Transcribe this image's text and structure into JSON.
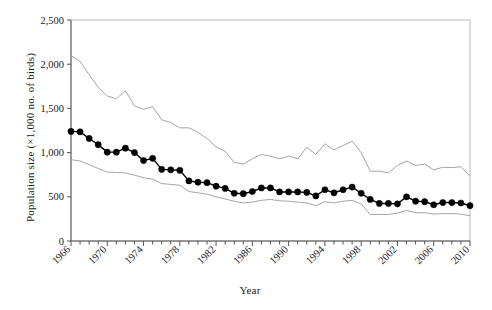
{
  "chart_data": {
    "type": "line",
    "title": "",
    "xlabel": "Year",
    "ylabel": "Population size (×1,000 no. of birds)",
    "xlim": [
      1966,
      2010
    ],
    "ylim": [
      0,
      2500
    ],
    "ytick_values": [
      0,
      500,
      1000,
      1500,
      2000,
      2500
    ],
    "ytick_labels": [
      "0",
      "500",
      "1,000",
      "1,500",
      "2,000",
      "2,500"
    ],
    "xtick_values": [
      1966,
      1970,
      1974,
      1978,
      1982,
      1986,
      1990,
      1994,
      1998,
      2002,
      2006,
      2010
    ],
    "xtick_labels": [
      "1966",
      "1970",
      "1974",
      "1978",
      "1982",
      "1986",
      "1990",
      "1994",
      "1998",
      "2002",
      "2006",
      "2010"
    ],
    "xtick_minor_step": 1,
    "xtick_label_rotation": -45,
    "grid": false,
    "legend": "none",
    "x": [
      1966,
      1967,
      1968,
      1969,
      1970,
      1971,
      1972,
      1973,
      1974,
      1975,
      1976,
      1977,
      1978,
      1979,
      1980,
      1981,
      1982,
      1983,
      1984,
      1985,
      1986,
      1987,
      1988,
      1989,
      1990,
      1991,
      1992,
      1993,
      1994,
      1995,
      1996,
      1997,
      1998,
      1999,
      2000,
      2001,
      2002,
      2003,
      2004,
      2005,
      2006,
      2007,
      2008,
      2009,
      2010
    ],
    "series": [
      {
        "name": "Estimate",
        "style": "line-with-filled-circle-markers",
        "color": "#000000",
        "marker": "filled-circle",
        "values": [
          1240,
          1235,
          1160,
          1090,
          1005,
          1005,
          1050,
          1000,
          910,
          935,
          810,
          805,
          800,
          680,
          665,
          660,
          620,
          595,
          540,
          535,
          560,
          600,
          600,
          555,
          555,
          555,
          550,
          510,
          580,
          545,
          580,
          610,
          540,
          470,
          425,
          425,
          420,
          500,
          450,
          445,
          410,
          435,
          435,
          430,
          400
        ]
      },
      {
        "name": "Upper confidence limit",
        "style": "thin-line",
        "color": "#9a9a9a",
        "marker": "none",
        "values": [
          2100,
          2030,
          1880,
          1740,
          1640,
          1610,
          1700,
          1530,
          1490,
          1520,
          1370,
          1340,
          1280,
          1280,
          1230,
          1160,
          1065,
          1015,
          890,
          870,
          930,
          980,
          960,
          930,
          960,
          930,
          1060,
          980,
          1100,
          1030,
          1080,
          1130,
          1000,
          790,
          790,
          770,
          855,
          905,
          855,
          870,
          805,
          835,
          830,
          840,
          735
        ]
      },
      {
        "name": "Lower confidence limit",
        "style": "thin-line",
        "color": "#9a9a9a",
        "marker": "none",
        "values": [
          920,
          905,
          865,
          820,
          780,
          775,
          770,
          745,
          715,
          700,
          650,
          640,
          630,
          560,
          545,
          530,
          500,
          475,
          450,
          430,
          440,
          460,
          470,
          455,
          450,
          440,
          430,
          400,
          445,
          430,
          450,
          460,
          420,
          300,
          300,
          300,
          315,
          345,
          320,
          320,
          305,
          310,
          310,
          305,
          285
        ]
      }
    ]
  }
}
